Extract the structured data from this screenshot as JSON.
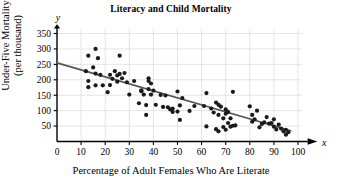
{
  "chart_data": {
    "type": "scatter",
    "title": "Literacy and Child Mortality",
    "xlabel": "Percentage of Adult Females Who Are Literate",
    "ylabel": "Under-Five Mortality\n(per thousand)",
    "x_axis_variable": "x",
    "y_axis_variable": "y",
    "xlim": [
      0,
      103
    ],
    "ylim": [
      0,
      370
    ],
    "xticks": [
      0,
      10,
      20,
      30,
      40,
      50,
      60,
      70,
      80,
      90,
      100
    ],
    "yticks": [
      50,
      100,
      150,
      200,
      250,
      300,
      350
    ],
    "grid": true,
    "grid_color": "#d8d8d8",
    "point_color": "#1a1a1a",
    "line_color": "#555555",
    "axis_color": "#000000",
    "background": "#ffffff",
    "trendline": {
      "label": "least-squares regression line",
      "x_start": 0,
      "y_start": 255,
      "x_end": 97,
      "y_end": 35
    },
    "points": [
      [
        12,
        228
      ],
      [
        13,
        278
      ],
      [
        13,
        176
      ],
      [
        13,
        196
      ],
      [
        15,
        240
      ],
      [
        16,
        300
      ],
      [
        16,
        220
      ],
      [
        16,
        182
      ],
      [
        17,
        270
      ],
      [
        18,
        216
      ],
      [
        19,
        182
      ],
      [
        21,
        160
      ],
      [
        22,
        216
      ],
      [
        22,
        183
      ],
      [
        23,
        203
      ],
      [
        24,
        228
      ],
      [
        25,
        214
      ],
      [
        25,
        194
      ],
      [
        26,
        278
      ],
      [
        26,
        219
      ],
      [
        27,
        205
      ],
      [
        28,
        222
      ],
      [
        29,
        192
      ],
      [
        30,
        152
      ],
      [
        32,
        196
      ],
      [
        34,
        124
      ],
      [
        35,
        163
      ],
      [
        35,
        166
      ],
      [
        36,
        152
      ],
      [
        37,
        118
      ],
      [
        37,
        86
      ],
      [
        38,
        205
      ],
      [
        38,
        196
      ],
      [
        38,
        170
      ],
      [
        39,
        188
      ],
      [
        39,
        152
      ],
      [
        40,
        165
      ],
      [
        41,
        119
      ],
      [
        43,
        151
      ],
      [
        44,
        112
      ],
      [
        45,
        149
      ],
      [
        46,
        111
      ],
      [
        47,
        104
      ],
      [
        48,
        96
      ],
      [
        48,
        107
      ],
      [
        50,
        162
      ],
      [
        50,
        97
      ],
      [
        51,
        117
      ],
      [
        51,
        70
      ],
      [
        52,
        141
      ],
      [
        55,
        99
      ],
      [
        57,
        115
      ],
      [
        61,
        115
      ],
      [
        62,
        157
      ],
      [
        62,
        49
      ],
      [
        64,
        107
      ],
      [
        65,
        94
      ],
      [
        66,
        126
      ],
      [
        66,
        40
      ],
      [
        67,
        119
      ],
      [
        67,
        86
      ],
      [
        67,
        33
      ],
      [
        68,
        113
      ],
      [
        69,
        75
      ],
      [
        69,
        47
      ],
      [
        70,
        104
      ],
      [
        70,
        90
      ],
      [
        70,
        38
      ],
      [
        71,
        96
      ],
      [
        71,
        60
      ],
      [
        72,
        75
      ],
      [
        72,
        48
      ],
      [
        73,
        161
      ],
      [
        73,
        51
      ],
      [
        74,
        52
      ],
      [
        80,
        114
      ],
      [
        81,
        86
      ],
      [
        81,
        64
      ],
      [
        82,
        72
      ],
      [
        83,
        100
      ],
      [
        84,
        46
      ],
      [
        85,
        57
      ],
      [
        86,
        62
      ],
      [
        87,
        79
      ],
      [
        88,
        58
      ],
      [
        89,
        60
      ],
      [
        90,
        72
      ],
      [
        90,
        48
      ],
      [
        91,
        39
      ],
      [
        92,
        55
      ],
      [
        93,
        42
      ],
      [
        94,
        33
      ],
      [
        95,
        38
      ],
      [
        95,
        22
      ],
      [
        96,
        30
      ]
    ]
  }
}
